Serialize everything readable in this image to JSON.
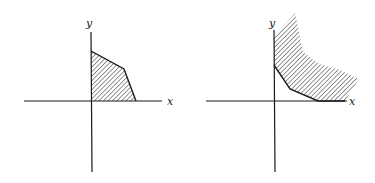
{
  "figures": [
    {
      "name": "bounded-feasible-region",
      "x_label": "x",
      "y_label": "y",
      "region": "bounded polygon in first quadrant (hatched)"
    },
    {
      "name": "unbounded-feasible-region",
      "x_label": "x",
      "y_label": "y",
      "region": "unbounded region above convex lower boundary (hatched)"
    }
  ],
  "colors": {
    "ink": "#1a1a1a",
    "background": "#ffffff"
  }
}
